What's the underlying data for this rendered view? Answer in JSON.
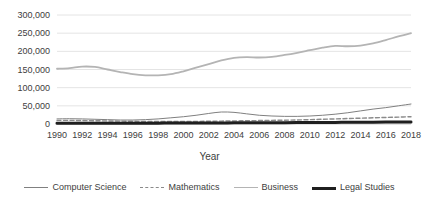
{
  "chart_data": {
    "type": "line",
    "title": "",
    "xlabel": "Year",
    "ylabel": "",
    "xlim": [
      1990,
      2018
    ],
    "ylim": [
      0,
      300000
    ],
    "grid": true,
    "legend_position": "bottom",
    "x": [
      1990,
      1991,
      1992,
      1993,
      1994,
      1995,
      1996,
      1997,
      1998,
      1999,
      2000,
      2001,
      2002,
      2003,
      2004,
      2005,
      2006,
      2007,
      2008,
      2009,
      2010,
      2011,
      2012,
      2013,
      2014,
      2015,
      2016,
      2017,
      2018
    ],
    "xtick_labels": [
      "1990",
      "1992",
      "1994",
      "1996",
      "1998",
      "2000",
      "2002",
      "2004",
      "2006",
      "2008",
      "2010",
      "2012",
      "2014",
      "2016",
      "2018"
    ],
    "ytick_labels": [
      "300,000",
      "250,000",
      "200,000",
      "150,000",
      "100,000",
      "50,000",
      "0"
    ],
    "ytick_values": [
      300000,
      250000,
      200000,
      150000,
      100000,
      50000,
      0
    ],
    "series": [
      {
        "name": "Computer Science",
        "color": "#808080",
        "style": "solid",
        "width": 1,
        "values": [
          14000,
          14500,
          14000,
          13000,
          12000,
          11000,
          11000,
          12000,
          14000,
          17000,
          20000,
          24000,
          29000,
          33000,
          32000,
          28000,
          24000,
          22000,
          21000,
          21000,
          22000,
          24000,
          27000,
          31000,
          36000,
          41000,
          45000,
          50000,
          55000
        ]
      },
      {
        "name": "Mathematics",
        "color": "#8a8a8a",
        "style": "dashed",
        "width": 1.4,
        "values": [
          10000,
          10000,
          9500,
          9000,
          8500,
          8000,
          7500,
          7200,
          7000,
          7000,
          7000,
          7200,
          7500,
          8000,
          8500,
          9000,
          9500,
          10000,
          10500,
          11000,
          12000,
          13000,
          14000,
          15000,
          16000,
          17000,
          18000,
          19000,
          20000
        ]
      },
      {
        "name": "Business",
        "color": "#b4b4b4",
        "style": "solid",
        "width": 1.8,
        "values": [
          152000,
          154000,
          158000,
          157000,
          150000,
          143000,
          137000,
          134000,
          134000,
          137000,
          145000,
          155000,
          165000,
          175000,
          182000,
          184000,
          183000,
          185000,
          190000,
          196000,
          203000,
          210000,
          215000,
          214000,
          216000,
          222000,
          231000,
          241000,
          250000
        ]
      },
      {
        "name": "Legal Studies",
        "color": "#1f1f1f",
        "style": "solid",
        "width": 3,
        "values": [
          2000,
          2000,
          2100,
          2100,
          2200,
          2200,
          2300,
          2300,
          2400,
          2500,
          2600,
          2700,
          2800,
          3000,
          3100,
          3200,
          3300,
          3400,
          3600,
          3800,
          4000,
          4200,
          4400,
          4600,
          4800,
          5000,
          5200,
          5400,
          5600
        ]
      }
    ]
  }
}
